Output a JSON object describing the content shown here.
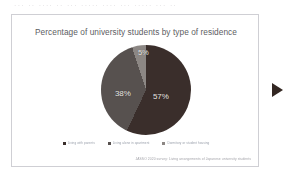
{
  "photo": {
    "top_cut_text": "···   ··   ····   ··   ···     ····· ····  ··· ·····  ··· ··",
    "background_color": "#ffffff"
  },
  "slide": {
    "border_color": "#cfcfd4",
    "background_color": "#ffffff",
    "source_caption": "JASSO 2020 survey: Living arrangements of Japanese university students"
  },
  "navigation": {
    "next_arrow_label": "next-slide-arrow",
    "next_arrow_color": "#332722"
  },
  "chart_data": {
    "type": "pie",
    "title": "Percentage of university students by type of residence",
    "categories": [
      "Living with parents",
      "Living alone in apartment",
      "Dormitory or student housing"
    ],
    "values": [
      57,
      38,
      5
    ],
    "value_labels": [
      "57%",
      "38%",
      "5%"
    ],
    "colors": [
      "#3a2e2b",
      "#57514f",
      "#8c8784"
    ],
    "legend": {
      "position": "bottom",
      "entries": [
        {
          "label": "Living with parents",
          "color": "#3a2e2b"
        },
        {
          "label": "Living alone in apartment",
          "color": "#57514f"
        },
        {
          "label": "Dormitory or student housing",
          "color": "#8c8784"
        }
      ]
    },
    "label_color": "#e9e7e4",
    "grid": false,
    "start_angle_deg": 0,
    "units": "percent"
  }
}
